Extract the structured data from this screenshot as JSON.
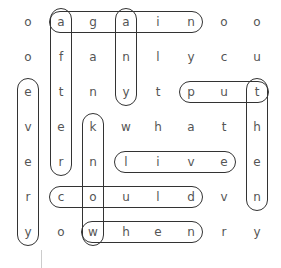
{
  "puzzle": {
    "grid": [
      [
        "o",
        "a",
        "g",
        "a",
        "i",
        "n",
        "o",
        "o"
      ],
      [
        "o",
        "f",
        "a",
        "n",
        "l",
        "y",
        "c",
        "u"
      ],
      [
        "e",
        "t",
        "n",
        "y",
        "t",
        "p",
        "u",
        "t"
      ],
      [
        "v",
        "e",
        "k",
        "w",
        "h",
        "a",
        "t",
        "h"
      ],
      [
        "e",
        "r",
        "n",
        "l",
        "i",
        "v",
        "e",
        "e"
      ],
      [
        "r",
        "c",
        "o",
        "u",
        "l",
        "d",
        "v",
        "n"
      ],
      [
        "y",
        "o",
        "w",
        "h",
        "e",
        "n",
        "r",
        "y"
      ]
    ],
    "found_words": [
      {
        "word": "again",
        "direction": "horizontal",
        "row": 0,
        "col_start": 1,
        "col_end": 5
      },
      {
        "word": "after",
        "direction": "vertical",
        "col": 1,
        "row_start": 0,
        "row_end": 4
      },
      {
        "word": "any",
        "direction": "vertical",
        "col": 3,
        "row_start": 0,
        "row_end": 2
      },
      {
        "word": "every",
        "direction": "vertical",
        "col": 0,
        "row_start": 2,
        "row_end": 6
      },
      {
        "word": "put",
        "direction": "horizontal",
        "row": 2,
        "col_start": 5,
        "col_end": 7
      },
      {
        "word": "then",
        "direction": "vertical",
        "col": 7,
        "row_start": 2,
        "row_end": 5
      },
      {
        "word": "know",
        "direction": "vertical",
        "col": 2,
        "row_start": 3,
        "row_end": 6
      },
      {
        "word": "live",
        "direction": "horizontal",
        "row": 4,
        "col_start": 3,
        "col_end": 6
      },
      {
        "word": "could",
        "direction": "horizontal",
        "row": 5,
        "col_start": 1,
        "col_end": 5
      },
      {
        "word": "when",
        "direction": "horizontal",
        "row": 6,
        "col_start": 2,
        "col_end": 5
      }
    ]
  }
}
